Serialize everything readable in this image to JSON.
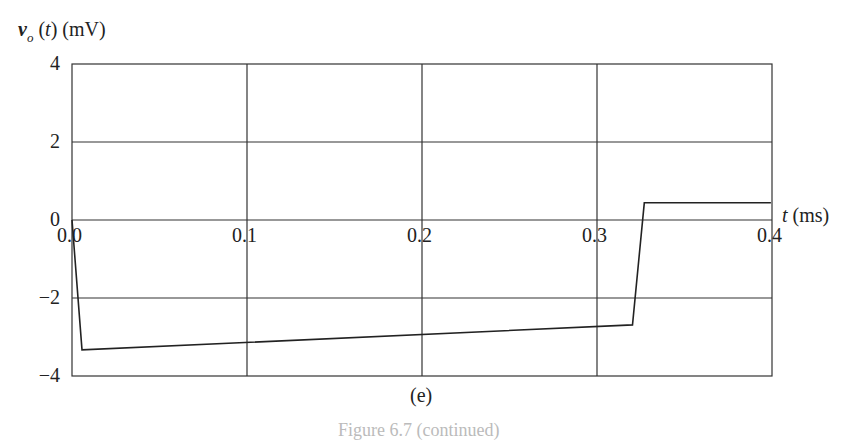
{
  "chart_data": {
    "type": "line",
    "title": "",
    "panel_label": "(e)",
    "caption": "Figure 6.7 (continued)",
    "ylabel": {
      "var": "v",
      "sub": "o",
      "arg": "(t)",
      "unit": "(mV)"
    },
    "xlabel": {
      "var": "t",
      "unit": "(ms)"
    },
    "xlim": [
      0,
      0.4
    ],
    "ylim": [
      -4,
      4
    ],
    "xticks": [
      "0.0",
      "0.1",
      "0.2",
      "0.3",
      "0.4"
    ],
    "yticks": [
      "4",
      "2",
      "0",
      "−2",
      "−4"
    ],
    "grid": true,
    "series": [
      {
        "name": "v_o(t)",
        "x": [
          0.0,
          0.0057,
          0.3203,
          0.327,
          0.3994
        ],
        "y": [
          0.0,
          -3.33,
          -2.69,
          0.44,
          0.44
        ]
      }
    ]
  }
}
